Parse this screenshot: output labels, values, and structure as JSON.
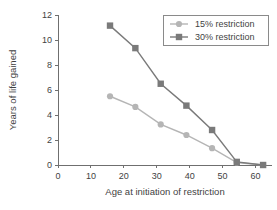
{
  "chart_data": {
    "type": "line",
    "title": "",
    "xlabel": "Age at initiation of restriction",
    "ylabel": "Years of life gained",
    "xlim": [
      0,
      65
    ],
    "ylim": [
      0,
      12
    ],
    "xticks": [
      0,
      10,
      20,
      30,
      40,
      50,
      60
    ],
    "yticks": [
      0,
      2,
      4,
      6,
      8,
      10,
      12
    ],
    "grid": false,
    "legend_position": "top-right",
    "series": [
      {
        "name": "15% restriction",
        "color": "#b5b5b5",
        "marker": "circle",
        "x": [
          15.8,
          23.5,
          31.2,
          39.0,
          46.8,
          54.3,
          62.3
        ],
        "values": [
          5.5,
          4.65,
          3.25,
          2.4,
          1.35,
          0.2,
          0.0
        ]
      },
      {
        "name": "30% restriction",
        "color": "#7a7a7a",
        "marker": "square",
        "x": [
          15.8,
          23.5,
          31.2,
          39.0,
          46.8,
          54.3,
          62.3
        ],
        "values": [
          11.15,
          9.35,
          6.5,
          4.75,
          2.8,
          0.25,
          0.0
        ]
      }
    ]
  },
  "legend": {
    "entries": [
      {
        "label": "15% restriction"
      },
      {
        "label": "30% restriction"
      }
    ]
  },
  "axes": {
    "x_title": "Age at initiation of restriction",
    "y_title": "Years of life gained",
    "x_tick_labels": [
      "0",
      "10",
      "20",
      "30",
      "40",
      "50",
      "60"
    ],
    "y_tick_labels": [
      "0",
      "2",
      "4",
      "6",
      "8",
      "10",
      "12"
    ]
  },
  "colors": {
    "series_light": "#b5b5b5",
    "series_dark": "#7a7a7a",
    "axis": "#6f6f6f",
    "text": "#3f3f3f",
    "background": "#ffffff"
  }
}
